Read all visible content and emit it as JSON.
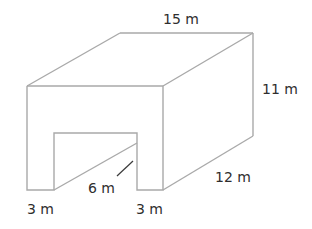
{
  "figure": {
    "labels": {
      "length_top": "15 m",
      "height": "11 m",
      "depth": "12 m",
      "tunnel_height": "6 m",
      "left_wall": "3 m",
      "right_wall": "3 m"
    },
    "colors": {
      "edge": "#a9a9a9",
      "text": "#2e2e2e"
    }
  }
}
